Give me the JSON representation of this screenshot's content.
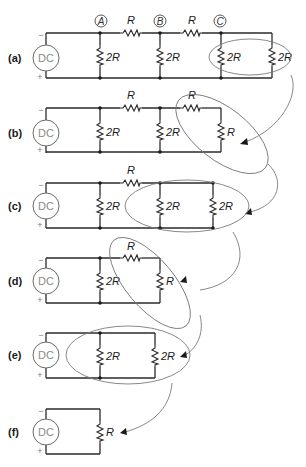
{
  "figure": {
    "source_label": "DC",
    "polarity": {
      "top": "−",
      "bottom": "+"
    },
    "colors": {
      "wire": "#2a2a2a",
      "ellipse": "#7a7a7a",
      "source_text": "#8a8a8a"
    },
    "steps": [
      {
        "id": "a",
        "label": "(a)",
        "nodes": [
          "A",
          "B",
          "C"
        ],
        "series_resistors": [
          {
            "label": "R",
            "between": "A-B"
          },
          {
            "label": "R",
            "between": "B-C"
          }
        ],
        "shunt_resistors": [
          {
            "label": "2R",
            "at": "A"
          },
          {
            "label": "2R",
            "at": "B"
          },
          {
            "label": "2R",
            "at": "C"
          },
          {
            "label": "2R",
            "at": "end"
          }
        ],
        "highlight": "last two 2R in parallel"
      },
      {
        "id": "b",
        "label": "(b)",
        "series_resistors": [
          {
            "label": "R"
          },
          {
            "label": "R"
          }
        ],
        "shunt_resistors": [
          {
            "label": "2R"
          },
          {
            "label": "2R"
          },
          {
            "label": "R"
          }
        ],
        "highlight": "series R + R"
      },
      {
        "id": "c",
        "label": "(c)",
        "series_resistors": [
          {
            "label": "R"
          }
        ],
        "shunt_resistors": [
          {
            "label": "2R"
          },
          {
            "label": "2R"
          },
          {
            "label": "2R"
          }
        ],
        "highlight": "last two 2R in parallel"
      },
      {
        "id": "d",
        "label": "(d)",
        "series_resistors": [
          {
            "label": "R"
          }
        ],
        "shunt_resistors": [
          {
            "label": "2R"
          },
          {
            "label": "R"
          }
        ],
        "highlight": "series R + R"
      },
      {
        "id": "e",
        "label": "(e)",
        "series_resistors": [],
        "shunt_resistors": [
          {
            "label": "2R"
          },
          {
            "label": "2R"
          }
        ],
        "highlight": "two 2R in parallel"
      },
      {
        "id": "f",
        "label": "(f)",
        "series_resistors": [],
        "shunt_resistors": [
          {
            "label": "R"
          }
        ],
        "highlight": "equivalent resistance"
      }
    ]
  },
  "labels": {
    "a": {
      "step": "(a)",
      "node_a": "A",
      "node_b": "B",
      "node_c": "C",
      "r1": "R",
      "r2": "R",
      "s1": "2R",
      "s2": "2R",
      "s3": "2R",
      "s4": "2R"
    },
    "b": {
      "step": "(b)",
      "r1": "R",
      "r2": "R",
      "s1": "2R",
      "s2": "2R",
      "s3": "R"
    },
    "c": {
      "step": "(c)",
      "r1": "R",
      "s1": "2R",
      "s2": "2R",
      "s3": "2R"
    },
    "d": {
      "step": "(d)",
      "r1": "R",
      "s1": "2R",
      "s2": "R"
    },
    "e": {
      "step": "(e)",
      "s1": "2R",
      "s2": "2R"
    },
    "f": {
      "step": "(f)",
      "s1": "R"
    },
    "src": "DC",
    "minus": "−",
    "plus": "+"
  }
}
